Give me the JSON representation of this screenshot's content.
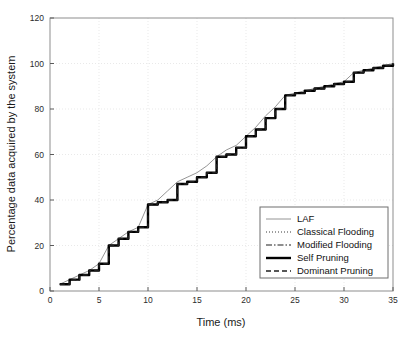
{
  "chart_data": {
    "type": "line",
    "title": "",
    "xlabel": "Time (ms)",
    "ylabel": "Percentage data acquired by the system",
    "xlim": [
      0,
      35
    ],
    "ylim": [
      0,
      120
    ],
    "xticks": [
      0,
      5,
      10,
      15,
      20,
      25,
      30,
      35
    ],
    "yticks": [
      0,
      20,
      40,
      60,
      80,
      100,
      120
    ],
    "grid": true,
    "legend_position": "lower right",
    "series": [
      {
        "name": "LAF",
        "style": "solid-thin",
        "color": "#7a7a7a",
        "x": [
          1,
          2,
          3,
          4,
          5,
          6,
          7,
          8,
          9,
          10,
          11,
          12,
          13,
          14,
          15,
          16,
          17,
          18,
          19,
          20,
          21,
          22,
          23,
          24,
          25,
          26,
          27,
          28,
          29,
          30,
          31,
          32,
          33,
          34,
          35
        ],
        "y": [
          3,
          5,
          7,
          9,
          12,
          20,
          23,
          26,
          28,
          38,
          40,
          44,
          48,
          50,
          52,
          55,
          59,
          62,
          64,
          68,
          72,
          77,
          81,
          86,
          87,
          88,
          89,
          90,
          91,
          92,
          96,
          97,
          98,
          99,
          100
        ]
      },
      {
        "name": "Classical Flooding",
        "style": "dotted",
        "color": "#3a3a3a",
        "x": [
          1,
          2,
          3,
          4,
          5,
          6,
          7,
          8,
          9,
          10,
          11,
          12,
          13,
          14,
          15,
          16,
          17,
          18,
          19,
          20,
          21,
          22,
          23,
          24,
          25,
          26,
          27,
          28,
          29,
          30,
          31,
          32,
          33,
          34,
          35
        ],
        "y": [
          3,
          5,
          7,
          9,
          12,
          20,
          23,
          26,
          28,
          38,
          39,
          40,
          47,
          48,
          50,
          52,
          59,
          60,
          63,
          68,
          71,
          76,
          80,
          86,
          87,
          88,
          89,
          90,
          91,
          92,
          96,
          97,
          98,
          99,
          100
        ]
      },
      {
        "name": "Modified Flooding",
        "style": "dashdot",
        "color": "#1f1f1f",
        "x": [
          1,
          2,
          3,
          4,
          5,
          6,
          7,
          8,
          9,
          10,
          11,
          12,
          13,
          14,
          15,
          16,
          17,
          18,
          19,
          20,
          21,
          22,
          23,
          24,
          25,
          26,
          27,
          28,
          29,
          30,
          31,
          32,
          33,
          34,
          35
        ],
        "y": [
          3,
          5,
          7,
          9,
          12,
          20,
          23,
          26,
          28,
          38,
          39,
          40,
          47,
          48,
          50,
          52,
          59,
          60,
          63,
          68,
          71,
          76,
          80,
          86,
          87,
          88,
          89,
          90,
          91,
          92,
          96,
          97,
          98,
          99,
          100
        ]
      },
      {
        "name": "Self Pruning",
        "style": "solid-thick",
        "color": "#000000",
        "x": [
          1,
          2,
          3,
          4,
          5,
          6,
          7,
          8,
          9,
          10,
          11,
          12,
          13,
          14,
          15,
          16,
          17,
          18,
          19,
          20,
          21,
          22,
          23,
          24,
          25,
          26,
          27,
          28,
          29,
          30,
          31,
          32,
          33,
          34,
          35
        ],
        "y": [
          3,
          5,
          7,
          9,
          12,
          20,
          23,
          26,
          28,
          38,
          39,
          40,
          47,
          48,
          50,
          52,
          59,
          60,
          63,
          68,
          71,
          76,
          80,
          86,
          87,
          88,
          89,
          90,
          91,
          92,
          96,
          97,
          98,
          99,
          100
        ]
      },
      {
        "name": "Dominant Pruning",
        "style": "dashed",
        "color": "#1f1f1f",
        "x": [
          1,
          2,
          3,
          4,
          5,
          6,
          7,
          8,
          9,
          10,
          11,
          12,
          13,
          14,
          15,
          16,
          17,
          18,
          19,
          20,
          21,
          22,
          23,
          24,
          25,
          26,
          27,
          28,
          29,
          30,
          31,
          32,
          33,
          34,
          35
        ],
        "y": [
          3,
          5,
          7,
          9,
          12,
          20,
          23,
          26,
          28,
          38,
          39,
          40,
          47,
          48,
          50,
          52,
          59,
          60,
          63,
          68,
          71,
          76,
          80,
          86,
          87,
          88,
          89,
          90,
          91,
          92,
          96,
          97,
          98,
          99,
          100
        ]
      }
    ]
  },
  "legend": {
    "entries": [
      {
        "label": "LAF"
      },
      {
        "label": "Classical Flooding"
      },
      {
        "label": "Modified Flooding"
      },
      {
        "label": "Self Pruning"
      },
      {
        "label": "Dominant Pruning"
      }
    ]
  }
}
